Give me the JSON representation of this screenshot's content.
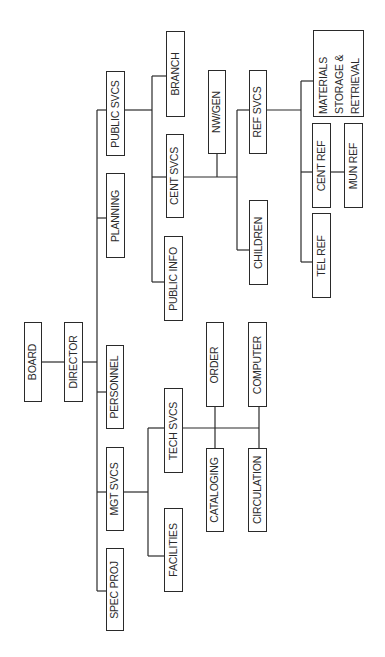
{
  "diagram": {
    "type": "org-chart",
    "orientation": "rotated-90-ccw",
    "line_color": "#2a2a2a",
    "box_border_color": "#2a2a2a",
    "text_color": "#2a2a2a",
    "background": "#ffffff"
  },
  "nodes": {
    "board": {
      "label": "BOARD",
      "box": [
        24,
        322,
        18,
        80
      ]
    },
    "director": {
      "label": "DIRECTOR",
      "box": [
        64,
        322,
        19,
        80
      ]
    },
    "public_svcs": {
      "label": "PUBLIC SVCS",
      "box": [
        106,
        71,
        19,
        85
      ]
    },
    "planning": {
      "label": "PLANNING",
      "box": [
        106,
        173,
        19,
        85
      ]
    },
    "personnel": {
      "label": "PERSONNEL",
      "box": [
        106,
        345,
        18,
        84
      ]
    },
    "mgt_svcs": {
      "label": "MGT SVCS",
      "box": [
        106,
        447,
        18,
        84
      ]
    },
    "spec_proj": {
      "label": "SPEC PROJ",
      "box": [
        106,
        548,
        18,
        83
      ]
    },
    "branch": {
      "label": "BRANCH",
      "box": [
        166,
        31,
        19,
        86
      ]
    },
    "cent_svcs": {
      "label": "CENT SVCS",
      "box": [
        166,
        134,
        18,
        84
      ]
    },
    "public_info": {
      "label": "PUBLIC INFO",
      "box": [
        164,
        236,
        19,
        85
      ]
    },
    "tech_svcs": {
      "label": "TECH SVCS",
      "box": [
        164,
        388,
        19,
        85
      ]
    },
    "facilities": {
      "label": "FACILITIES",
      "box": [
        164,
        508,
        19,
        84
      ]
    },
    "nw_gen": {
      "label": "NW/GEN",
      "box": [
        208,
        70,
        18,
        84
      ]
    },
    "children": {
      "label": "CHILDREN",
      "box": [
        249,
        200,
        19,
        85
      ]
    },
    "ref_svcs": {
      "label": "REF SVCS",
      "box": [
        249,
        70,
        18,
        84
      ]
    },
    "order": {
      "label": "ORDER",
      "box": [
        206,
        322,
        18,
        85
      ]
    },
    "cataloging": {
      "label": "CATALOGING",
      "box": [
        206,
        448,
        18,
        84
      ]
    },
    "computer": {
      "label": "COMPUTER",
      "box": [
        248,
        322,
        19,
        85
      ]
    },
    "circulation": {
      "label": "CIRCULATION",
      "box": [
        248,
        448,
        19,
        84
      ]
    },
    "materials": {
      "label_lines": [
        "MATERIALS",
        "STORAGE &",
        "RETRIEVAL"
      ],
      "box": [
        313,
        30,
        51,
        87
      ]
    },
    "cent_ref": {
      "label": "CENT REF",
      "box": [
        312,
        123,
        19,
        85
      ]
    },
    "mun_ref": {
      "label": "MUN REF",
      "box": [
        344,
        123,
        19,
        85
      ]
    },
    "tel_ref": {
      "label": "TEL REF",
      "box": [
        312,
        213,
        19,
        85
      ]
    }
  },
  "edges": [
    [
      "board",
      "director"
    ],
    [
      "director",
      "public_svcs"
    ],
    [
      "director",
      "planning"
    ],
    [
      "director",
      "personnel"
    ],
    [
      "director",
      "mgt_svcs"
    ],
    [
      "director",
      "spec_proj"
    ],
    [
      "public_svcs",
      "branch"
    ],
    [
      "public_svcs",
      "cent_svcs"
    ],
    [
      "public_svcs",
      "public_info"
    ],
    [
      "cent_svcs",
      "nw_gen"
    ],
    [
      "cent_svcs",
      "ref_svcs"
    ],
    [
      "cent_svcs",
      "children"
    ],
    [
      "ref_svcs",
      "materials"
    ],
    [
      "ref_svcs",
      "cent_ref"
    ],
    [
      "ref_svcs",
      "tel_ref"
    ],
    [
      "cent_ref",
      "mun_ref"
    ],
    [
      "mgt_svcs",
      "tech_svcs"
    ],
    [
      "mgt_svcs",
      "facilities"
    ],
    [
      "tech_svcs",
      "order"
    ],
    [
      "tech_svcs",
      "cataloging"
    ],
    [
      "tech_svcs",
      "computer"
    ],
    [
      "tech_svcs",
      "circulation"
    ]
  ],
  "connector_paths": [
    "M42 362 H64",
    "M83 362 H97",
    "M97 110 V591",
    "M97 110 H106",
    "M97 218 H106",
    "M97 392 H106",
    "M97 492 H106",
    "M97 591 H106",
    "M125 110 H152",
    "M152 76 V282",
    "M152 76 H166",
    "M152 177 H166",
    "M152 282 H164",
    "M184 177 H237",
    "M217 154 V177",
    "M237 110 V250",
    "M237 110 H249",
    "M237 250 H249",
    "M267 110 H301",
    "M301 81 V262",
    "M301 81 H313",
    "M301 172 H312",
    "M301 262 H312",
    "M331 172 H344",
    "M124 492 H148",
    "M148 428 V556",
    "M148 428 H164",
    "M148 556 H164",
    "M183 428 H259",
    "M215 407 V448",
    "M259 407 V448"
  ]
}
